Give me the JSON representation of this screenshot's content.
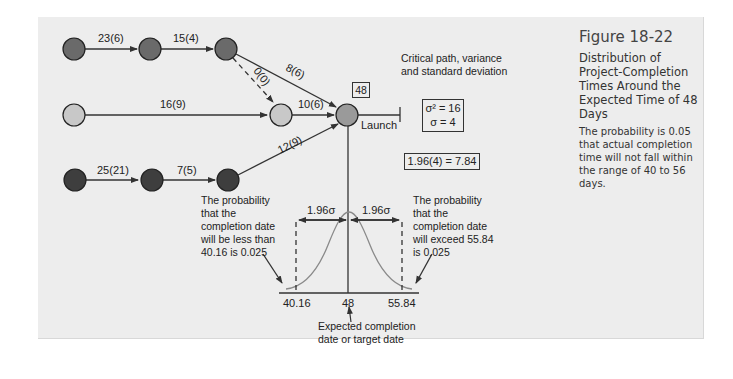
{
  "figure": {
    "title": "Figure 18-22",
    "subtitle": "Distribution of Project-Completion Times Around the Expected Time of 48 Days",
    "description": "The probability is 0.05 that actual completion time will not fall within the range of 40 to 56 days."
  },
  "network": {
    "nodes": [
      {
        "id": "a1",
        "row": 1,
        "shade": "medium-dark",
        "color": "#6a6a6a"
      },
      {
        "id": "a2",
        "row": 1,
        "shade": "medium-dark",
        "color": "#6a6a6a"
      },
      {
        "id": "a3",
        "row": 1,
        "shade": "medium-dark",
        "color": "#6a6a6a"
      },
      {
        "id": "b1",
        "row": 2,
        "shade": "light",
        "color": "#c8c8c8"
      },
      {
        "id": "b2",
        "row": 2,
        "shade": "light",
        "color": "#c8c8c8"
      },
      {
        "id": "c1",
        "row": 3,
        "shade": "dark",
        "color": "#3e3e3e"
      },
      {
        "id": "c2",
        "row": 3,
        "shade": "dark",
        "color": "#3e3e3e"
      },
      {
        "id": "c3",
        "row": 3,
        "shade": "dark",
        "color": "#3e3e3e"
      },
      {
        "id": "end",
        "row": 2,
        "shade": "medium",
        "color": "#9a9a9a"
      }
    ],
    "edges": [
      {
        "from": "a1",
        "to": "a2",
        "label": "23(6)"
      },
      {
        "from": "a2",
        "to": "a3",
        "label": "15(4)"
      },
      {
        "from": "a3",
        "to": "end",
        "label": "8(6)"
      },
      {
        "from": "a3",
        "to": "b2",
        "label": "0(0)",
        "style": "dashed"
      },
      {
        "from": "b1",
        "to": "b2",
        "label": "16(9)"
      },
      {
        "from": "b2",
        "to": "end",
        "label": "10(6)"
      },
      {
        "from": "c1",
        "to": "c2",
        "label": "25(21)"
      },
      {
        "from": "c2",
        "to": "c3",
        "label": "7(5)"
      },
      {
        "from": "c3",
        "to": "end",
        "label": "12(9)"
      }
    ],
    "end_value": "48",
    "launch_label": "Launch"
  },
  "critical_path_note": "Critical path, variance and standard deviation",
  "variance_box": {
    "variance": "σ² = 16",
    "std_dev": "σ = 4"
  },
  "calc_box": "1.96(4) = 7.84",
  "distribution": {
    "left_interval_label": "1.96σ",
    "right_interval_label": "1.96σ",
    "axis_ticks": [
      "40.16",
      "48",
      "55.84"
    ],
    "left_note": "The probability that the completion date will be less than 40.16 is 0.025",
    "right_note": "The probability that the completion date will exceed 55.84 is 0.025",
    "center_note": "Expected completion date or target date"
  },
  "colors": {
    "panel_bg": "#ededed",
    "line": "#333333",
    "curve": "#8a8a8a"
  }
}
